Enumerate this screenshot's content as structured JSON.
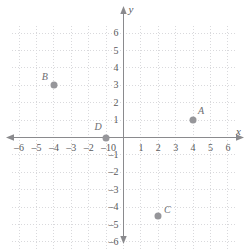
{
  "chart_data": {
    "type": "scatter",
    "title": "",
    "xlabel": "x",
    "ylabel": "y",
    "xlim": [
      -6.4,
      6.4
    ],
    "ylim": [
      -6.4,
      6.4
    ],
    "grid": true,
    "grid_style": "dotted",
    "legend": "none",
    "x_ticks": [
      -6,
      -5,
      -4,
      -3,
      -2,
      -1,
      0,
      1,
      2,
      3,
      4,
      5,
      6
    ],
    "y_ticks": [
      6,
      5,
      4,
      3,
      2,
      1,
      0,
      -1,
      -2,
      -3,
      -4,
      -5,
      -6
    ],
    "x_tick_labels": [
      "–6",
      "–5",
      "–4",
      "–3",
      "–2",
      "–1",
      "0",
      "1",
      "2",
      "3",
      "4",
      "5",
      "6"
    ],
    "y_tick_labels": [
      "6",
      "5",
      "4",
      "3",
      "2",
      "1",
      "0",
      "–1",
      "–2",
      "–3",
      "–4",
      "–5",
      "–6"
    ],
    "points": [
      {
        "label": "A",
        "x": 4,
        "y": 1,
        "label_dx": 8,
        "label_dy": -9
      },
      {
        "label": "B",
        "x": -4,
        "y": 3,
        "label_dx": -9,
        "label_dy": -8
      },
      {
        "label": "C",
        "x": 2,
        "y": -4.5,
        "label_dx": 9,
        "label_dy": -6
      },
      {
        "label": "D",
        "x": -1,
        "y": 0,
        "label_dx": -8,
        "label_dy": -11
      }
    ],
    "colors": {
      "point_fill": "#96969a",
      "axis": "#8a8a8d",
      "grid": "#d9d9dc",
      "text": "#59595b"
    }
  }
}
